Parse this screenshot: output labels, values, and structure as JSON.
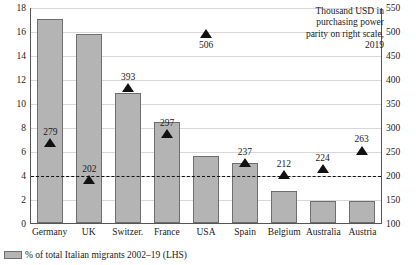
{
  "chart_data": {
    "type": "bar",
    "title": "",
    "subtitle": "",
    "xlabel": "",
    "ylabel": "",
    "categories": [
      "Germany",
      "UK",
      "Switzer.",
      "France",
      "USA",
      "Spain",
      "Belgium",
      "Australia",
      "Austria"
    ],
    "series": [
      {
        "name": "% of total Italian migrants 2002–19 (LHS)",
        "type": "bar",
        "axis": "left",
        "values": [
          17.0,
          15.75,
          10.8,
          8.4,
          5.6,
          5.0,
          2.7,
          1.85,
          1.8
        ]
      },
      {
        "name": "Thousand USD in purchasing power parity on right scale, 2019",
        "type": "marker",
        "axis": "right",
        "marker": "triangle-up",
        "values": [
          279,
          202,
          393,
          297,
          506,
          237,
          212,
          224,
          263
        ],
        "label_positions": [
          "above",
          "above",
          "above",
          "above",
          "below",
          "above",
          "above",
          "above",
          "above"
        ]
      }
    ],
    "left_axis": {
      "ticks": [
        0,
        2,
        4,
        6,
        8,
        10,
        12,
        14,
        16,
        18
      ],
      "ylim": [
        0,
        18
      ],
      "label": ""
    },
    "right_axis": {
      "ticks": [
        100,
        150,
        200,
        250,
        300,
        350,
        400,
        450,
        500,
        550
      ],
      "ylim": [
        100,
        550
      ],
      "label": ""
    },
    "reference_line": {
      "axis": "right",
      "value": 200,
      "style": "dashed"
    },
    "grid": true,
    "legend_position": "bottom-left",
    "annotation": "Thousand USD in purchasing power parity on right scale, 2019",
    "colors": {
      "bar_fill": "#b4b4b4",
      "bar_border": "#6f6f6f",
      "marker": "#111111",
      "grid": "#d8d8d8",
      "axis": "#555555",
      "text": "#1a1a1a"
    }
  },
  "legend": {
    "items": [
      {
        "label": "% of total Italian migrants 2002–19 (LHS)",
        "swatch": "bar-swatch"
      }
    ]
  }
}
